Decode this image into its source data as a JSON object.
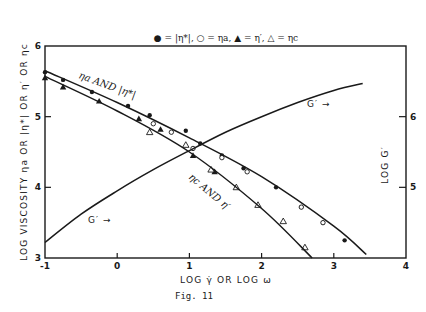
{
  "figure": {
    "caption": "Fig. 11",
    "legend": {
      "text": "● = |η*|,  ○ = ηa,  ▲ = η′,  △ = ηc",
      "items": [
        {
          "marker": "filled-circle",
          "label": "|η*|"
        },
        {
          "marker": "open-circle",
          "label": "ηa"
        },
        {
          "marker": "filled-triangle",
          "label": "η′"
        },
        {
          "marker": "open-triangle",
          "label": "ηc"
        }
      ]
    },
    "x_axis_label": "LOG γ̇  OR  LOG ω",
    "y_left_label": "LOG VISCOSITY  ηa OR |η*| OR η′ OR ηc",
    "y_right_label": "LOG G′",
    "x_ticks": [
      "-1",
      "0",
      "1",
      "2",
      "3",
      "4"
    ],
    "y_left_ticks": [
      "3",
      "4",
      "5",
      "6"
    ],
    "y_right_ticks": [
      "5",
      "6"
    ],
    "annotations": {
      "upper_curve": "ηa AND |η*|",
      "lower_curve": "ηc AND η′",
      "g_prime_upper": "G′ →",
      "g_prime_lower": "G′ →"
    }
  },
  "chart_data": {
    "type": "line",
    "title": "● = |η*|, ○ = ηa, ▲ = η′, △ = ηc",
    "caption": "Fig. 11",
    "xlabel": "LOG γ̇ OR LOG ω",
    "ylabel": "LOG VISCOSITY ηa OR |η*| OR η′ OR ηc",
    "y2label": "LOG G′",
    "xlim": [
      -1,
      4
    ],
    "ylim": [
      3,
      6
    ],
    "y2lim": [
      4,
      7
    ],
    "x_ticks": [
      -1,
      0,
      1,
      2,
      3,
      4
    ],
    "y_ticks": [
      3,
      4,
      5,
      6
    ],
    "y2_ticks": [
      5,
      6
    ],
    "grid": false,
    "legend_position": "top-center",
    "series": [
      {
        "name": "|η*| (filled circles)",
        "axis": "left",
        "marker": "filled-circle",
        "x": [
          -1.0,
          -0.75,
          -0.35,
          0.15,
          0.45,
          0.95,
          1.15,
          1.45,
          1.75,
          2.2,
          2.55,
          2.85,
          3.15
        ],
        "y": [
          5.63,
          5.52,
          5.35,
          5.15,
          5.02,
          4.8,
          4.62,
          4.45,
          4.27,
          4.0,
          3.72,
          3.5,
          3.25
        ]
      },
      {
        "name": "ηa (open circles)",
        "axis": "left",
        "marker": "open-circle",
        "x": [
          0.5,
          0.75,
          1.05,
          1.45,
          1.8,
          2.55,
          2.85
        ],
        "y": [
          4.9,
          4.78,
          4.55,
          4.42,
          4.22,
          3.72,
          3.5
        ]
      },
      {
        "name": "η′ (filled triangles)",
        "axis": "left",
        "marker": "filled-triangle",
        "x": [
          -1.0,
          -0.75,
          -0.25,
          0.3,
          0.6,
          1.05,
          1.35
        ],
        "y": [
          5.55,
          5.42,
          5.22,
          4.97,
          4.82,
          4.45,
          4.22
        ]
      },
      {
        "name": "ηc (open triangles)",
        "axis": "left",
        "marker": "open-triangle",
        "x": [
          0.45,
          0.95,
          1.3,
          1.65,
          1.95,
          2.3,
          2.6
        ],
        "y": [
          4.78,
          4.6,
          4.25,
          4.0,
          3.75,
          3.52,
          3.15
        ]
      },
      {
        "name": "ηa AND |η*| (fitted line)",
        "axis": "left",
        "x": [
          -1.0,
          0.0,
          1.0,
          2.0,
          3.0,
          3.45
        ],
        "y": [
          5.65,
          5.2,
          4.7,
          4.15,
          3.45,
          3.05
        ]
      },
      {
        "name": "ηc AND η′ (fitted line)",
        "axis": "left",
        "x": [
          -1.0,
          0.0,
          1.0,
          2.0,
          2.7
        ],
        "y": [
          5.57,
          5.08,
          4.5,
          3.7,
          3.0
        ]
      },
      {
        "name": "G′",
        "axis": "right",
        "x": [
          -1.0,
          -0.5,
          0.0,
          0.5,
          1.0,
          1.5,
          2.0,
          2.5,
          3.0,
          3.4
        ],
        "y": [
          4.22,
          4.62,
          4.95,
          5.25,
          5.52,
          5.78,
          6.0,
          6.2,
          6.37,
          6.47
        ]
      }
    ]
  }
}
